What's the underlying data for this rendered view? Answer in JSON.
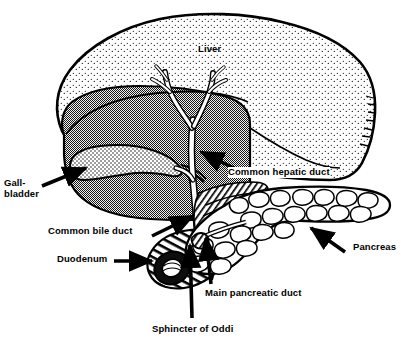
{
  "figure": {
    "background_color": "#ffffff",
    "ink_color": "#000000",
    "liver_shade_color": "#8c8c8c",
    "width": 401,
    "height": 345
  },
  "labels": {
    "liver": "Liver",
    "gallbladder_line1": "Gall-",
    "gallbladder_line2": "bladder",
    "common_hepatic_duct": "Common hepatic duct",
    "common_bile_duct": "Common bile duct",
    "duodenum": "Duodenum",
    "pancreas": "Pancreas",
    "main_pancreatic_duct": "Main pancreatic duct",
    "sphincter_of_oddi": "Sphincter of Oddi"
  },
  "structures": [
    {
      "name": "liver",
      "shading": "stipple-and-gray"
    },
    {
      "name": "gallbladder",
      "shading": "stipple"
    },
    {
      "name": "common-hepatic-duct",
      "shading": "white-outline"
    },
    {
      "name": "common-bile-duct",
      "shading": "white-outline"
    },
    {
      "name": "pancreas",
      "shading": "lobules"
    },
    {
      "name": "duodenum",
      "shading": "cut-tube"
    },
    {
      "name": "main-pancreatic-duct",
      "shading": "white-outline"
    },
    {
      "name": "sphincter-of-oddi",
      "shading": "hatched"
    }
  ]
}
